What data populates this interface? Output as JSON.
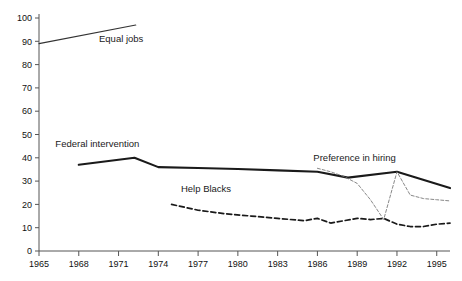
{
  "chart_data": {
    "type": "line",
    "title": "",
    "subtitle": "",
    "xlabel": "",
    "ylabel": "",
    "xlim": [
      1965,
      1996
    ],
    "ylim": [
      0,
      100
    ],
    "grid": false,
    "legend_position": "inline-annotations",
    "y_ticks": [
      0,
      10,
      20,
      30,
      40,
      50,
      60,
      70,
      80,
      90,
      100
    ],
    "y_tick_labels": [
      "0",
      "10",
      "20",
      "30",
      "40",
      "50",
      "60",
      "70",
      "80",
      "90",
      "100"
    ],
    "x_ticks": [
      1965,
      1968,
      1971,
      1974,
      1977,
      1980,
      1983,
      1986,
      1989,
      1992,
      1995
    ],
    "x_tick_labels": [
      "1965",
      "1968",
      "1971",
      "1974",
      "1977",
      "1980",
      "1983",
      "1986",
      "1989",
      "1992",
      "1995"
    ],
    "series": [
      {
        "name": "Equal jobs",
        "style": "solid-thin",
        "color": "#333333",
        "label_position": {
          "x": 1971.2,
          "y": 89.5
        },
        "x": [
          1965,
          1972.3
        ],
        "values": [
          89,
          97
        ]
      },
      {
        "name": "Federal intervention",
        "style": "solid-thick",
        "color": "#1a1a1a",
        "label_position": {
          "x": 1969.4,
          "y": 44.5
        },
        "x": [
          1968,
          1972.2,
          1974,
          1977,
          1980,
          1983,
          1986,
          1988.3,
          1992,
          1996
        ],
        "values": [
          37,
          40,
          36,
          35.6,
          35.2,
          34.6,
          34,
          31.5,
          34,
          27
        ]
      },
      {
        "name": "Help Blacks",
        "style": "dashed",
        "color": "#1a1a1a",
        "label_position": {
          "x": 1977.6,
          "y": 25.5
        },
        "x": [
          1975,
          1977,
          1979,
          1981,
          1983,
          1985,
          1986,
          1987,
          1988,
          1989,
          1990,
          1991,
          1992,
          1993,
          1994,
          1995,
          1996
        ],
        "values": [
          20,
          17.5,
          16,
          15,
          14,
          13,
          14,
          12,
          13,
          14,
          13.5,
          14,
          11.5,
          10.5,
          10.5,
          11.5,
          12
        ]
      },
      {
        "name": "Preference in hiring",
        "style": "dashed-thin",
        "color": "#7a7a7a",
        "label_position": {
          "x": 1988.8,
          "y": 38.5
        },
        "x": [
          1986,
          1987,
          1988,
          1989,
          1990,
          1991,
          1992,
          1993,
          1994,
          1995,
          1996
        ],
        "values": [
          35.5,
          34,
          32,
          29,
          22,
          13.5,
          34,
          24,
          22.5,
          22,
          21.5
        ]
      }
    ]
  }
}
